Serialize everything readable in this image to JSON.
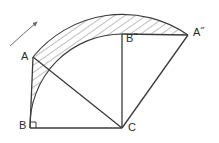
{
  "figure": {
    "background_color": "#ffffff",
    "stroke_color": "#3a3a3a",
    "hatch_color": "#6e6e6e",
    "label_color": "#2b2b2b",
    "width": 219,
    "height": 143
  },
  "labels": {
    "a": "A",
    "b": "B",
    "c": "C",
    "a_image": "A˝",
    "b_image": "B˝"
  },
  "points": {
    "A": {
      "x": 33,
      "y": 57
    },
    "B": {
      "x": 30,
      "y": 128
    },
    "C": {
      "x": 122,
      "y": 128
    },
    "A2": {
      "x": 188,
      "y": 35
    },
    "B2": {
      "x": 122,
      "y": 34
    }
  },
  "label_positions": {
    "A": {
      "x": 21,
      "y": 51
    },
    "B": {
      "x": 19,
      "y": 120
    },
    "C": {
      "x": 128,
      "y": 122
    },
    "A2": {
      "x": 193,
      "y": 27
    },
    "B2": {
      "x": 126,
      "y": 33
    }
  },
  "elements": {
    "right_angle_marker": "right-angle-at-B",
    "rotation_arrow": "curved-rotation-arrow",
    "swept_region": "hatched-annulus-sector",
    "radius_outer": 115,
    "radius_inner": 92
  }
}
